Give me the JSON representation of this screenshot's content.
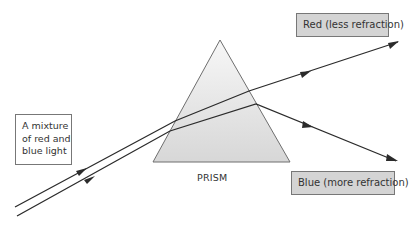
{
  "diagram": {
    "labels": {
      "incoming": "A mixture of red and blue light",
      "incoming_lines": [
        "A mixture",
        "of red and",
        "blue light"
      ],
      "prism": "PRISM",
      "red": "Red (less refraction)",
      "blue": "Blue (more refraction)"
    },
    "colors": {
      "ray": "#2b2b2b",
      "prism_edge": "#6e6e6e",
      "prism_fill_top": "#f5f5f5",
      "prism_fill_bottom": "#d9d9d9",
      "label_box_fill": "#d4d4d4",
      "label_box_border": "#777777",
      "text": "#333333"
    },
    "prism": {
      "apex": [
        220,
        40
      ],
      "base_left": [
        153,
        162
      ],
      "base_right": [
        290,
        162
      ]
    },
    "rays": {
      "red": {
        "points": [
          [
            15,
            207
          ],
          [
            175,
            121
          ],
          [
            249,
            91
          ],
          [
            398,
            42
          ]
        ],
        "arrows": [
          [
            82,
            171
          ],
          [
            306,
            73
          ],
          [
            394,
            44
          ]
        ]
      },
      "blue": {
        "points": [
          [
            17,
            216
          ],
          [
            170,
            131
          ],
          [
            256,
            104
          ],
          [
            396,
            161
          ]
        ],
        "arrows": [
          [
            90,
            180
          ],
          [
            309,
            126
          ],
          [
            393,
            159
          ]
        ]
      }
    }
  }
}
